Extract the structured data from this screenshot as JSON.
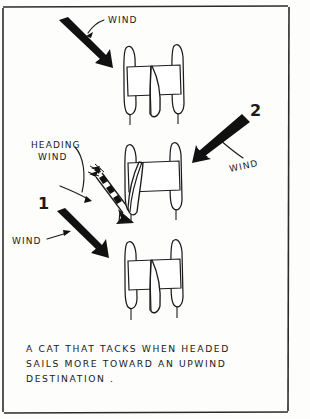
{
  "figure": {
    "medium": "hand-drawn ink sketch",
    "background_color": "#fdfdfc",
    "ink_color": "#1c1c1c"
  },
  "caption": {
    "line1": "A  CAT  THAT  TACKS   WHEN  HEADED",
    "line2": "SAILS  MORE  TOWARD  AN  UPWIND",
    "line3": "DESTINATION ."
  },
  "labels": {
    "wind_top": "WIND",
    "wind_right": "WIND",
    "wind_left": "WIND",
    "heading_wind_line1": "HEADING",
    "heading_wind_line2": "WIND",
    "number_one": "1",
    "number_two": "2"
  },
  "boats": [
    {
      "name": "catamaran-top",
      "position": "upper-center"
    },
    {
      "name": "catamaran-middle",
      "position": "center"
    },
    {
      "name": "catamaran-bottom",
      "position": "lower-center"
    }
  ],
  "arrows": [
    {
      "name": "wind-arrow-top",
      "direction": "down-right",
      "style": "solid-bold"
    },
    {
      "name": "wind-arrow-right",
      "direction": "down-left",
      "style": "solid-bold"
    },
    {
      "name": "wind-arrow-left",
      "direction": "down-right",
      "style": "solid-bold"
    },
    {
      "name": "heading-wind-arrow",
      "direction": "down-right",
      "style": "feathered-striped"
    }
  ],
  "icons": {
    "frame": "border-frame-icon",
    "hull": "catamaran-hull-icon",
    "sail": "sail-icon",
    "arrow": "arrow-icon"
  }
}
